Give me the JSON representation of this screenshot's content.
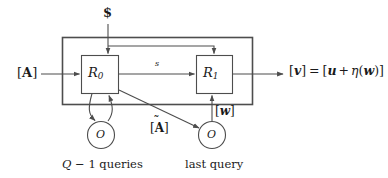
{
  "figure": {
    "type": "block-diagram",
    "background_color": "#ffffff",
    "line_color": "#4d4d4d",
    "text_color": "#1a1a1a"
  },
  "nodes": {
    "randomness_source": {
      "label": "$",
      "icon": "dollar-sign-glyph"
    },
    "r0_box": {
      "label_base": "R",
      "label_sub": "0"
    },
    "r1_box": {
      "label_base": "R",
      "label_sub": "1"
    },
    "oracle_left": {
      "label": "O",
      "caption_pre": "Q",
      "caption_mid": " − 1 ",
      "caption_post": "queries",
      "caption_full": "Q − 1 queries"
    },
    "oracle_right": {
      "label": "O",
      "caption": "last query"
    }
  },
  "edges": {
    "input_left": {
      "label_open": "[",
      "label_var": "A",
      "label_close": "]",
      "label_full": "[A]"
    },
    "state_between": {
      "label": "s"
    },
    "oracle_response": {
      "label_open": "[",
      "label_var": "w",
      "label_close": "]",
      "label_full": "[w]"
    },
    "last_query_input": {
      "label_open": "[",
      "label_var": "A",
      "label_accent": "̃",
      "label_close": "]",
      "label_full": "[Ã]"
    },
    "output_right": {
      "lhs_open": "[",
      "lhs_var": "v",
      "lhs_close": "]",
      "equals": "=",
      "rhs_open": "[",
      "rhs_u": "u",
      "rhs_plus": "+",
      "rhs_eta": "η",
      "rhs_paren_open": "(",
      "rhs_w": "w",
      "rhs_paren_close": ")",
      "rhs_close": "]",
      "full": "[v] = [u + η(w)]"
    }
  }
}
